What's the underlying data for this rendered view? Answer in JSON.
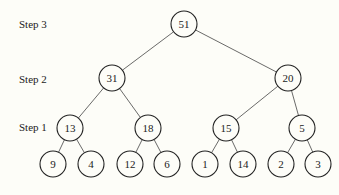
{
  "diagram": {
    "type": "binary-tree",
    "step_labels": [
      {
        "text": "Step 3",
        "x": 19,
        "y": 25
      },
      {
        "text": "Step 2",
        "x": 19,
        "y": 80
      },
      {
        "text": "Step 1",
        "x": 19,
        "y": 128
      }
    ],
    "nodes": [
      {
        "id": "n51",
        "value": "51",
        "x": 184,
        "y": 24
      },
      {
        "id": "n31",
        "value": "31",
        "x": 112,
        "y": 78
      },
      {
        "id": "n20",
        "value": "20",
        "x": 288,
        "y": 78
      },
      {
        "id": "n13",
        "value": "13",
        "x": 70,
        "y": 128
      },
      {
        "id": "n18",
        "value": "18",
        "x": 148,
        "y": 128
      },
      {
        "id": "n15",
        "value": "15",
        "x": 226,
        "y": 128
      },
      {
        "id": "n5",
        "value": "5",
        "x": 302,
        "y": 128
      },
      {
        "id": "n9",
        "value": "9",
        "x": 53,
        "y": 164
      },
      {
        "id": "n4",
        "value": "4",
        "x": 91,
        "y": 164
      },
      {
        "id": "n12",
        "value": "12",
        "x": 130,
        "y": 164
      },
      {
        "id": "n6",
        "value": "6",
        "x": 167,
        "y": 164
      },
      {
        "id": "n1",
        "value": "1",
        "x": 205,
        "y": 164
      },
      {
        "id": "n14",
        "value": "14",
        "x": 243,
        "y": 164
      },
      {
        "id": "n2",
        "value": "2",
        "x": 281,
        "y": 164
      },
      {
        "id": "n3",
        "value": "3",
        "x": 318,
        "y": 164
      }
    ],
    "edges": [
      [
        "n51",
        "n31"
      ],
      [
        "n51",
        "n20"
      ],
      [
        "n31",
        "n13"
      ],
      [
        "n31",
        "n18"
      ],
      [
        "n20",
        "n15"
      ],
      [
        "n20",
        "n5"
      ],
      [
        "n13",
        "n9"
      ],
      [
        "n13",
        "n4"
      ],
      [
        "n18",
        "n12"
      ],
      [
        "n18",
        "n6"
      ],
      [
        "n15",
        "n1"
      ],
      [
        "n15",
        "n14"
      ],
      [
        "n5",
        "n2"
      ],
      [
        "n5",
        "n3"
      ]
    ],
    "node_radius": 13,
    "colors": {
      "stroke": "#222222",
      "fill": "#fdfdf8",
      "edge": "#444444"
    }
  }
}
